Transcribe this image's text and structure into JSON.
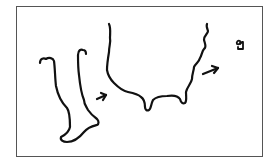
{
  "figure": {
    "frame_color": "#555555",
    "stroke_color": "#111111",
    "elements": [
      {
        "name": "leg-foot-outline",
        "label": "Leg and foot outline"
      },
      {
        "name": "arrow-1",
        "label": "Arrow pointing right"
      },
      {
        "name": "wavy-outline",
        "label": "Wavy U-shaped outline"
      },
      {
        "name": "arrow-2",
        "label": "Arrow pointing right"
      },
      {
        "name": "symbol-mark",
        "label": "Small handwritten symbol"
      }
    ]
  }
}
